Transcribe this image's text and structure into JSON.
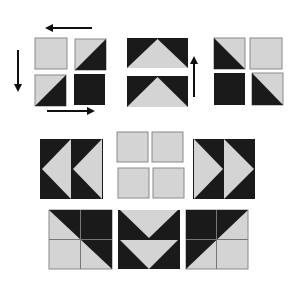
{
  "diagram": {
    "title": "",
    "colors": {
      "dark": "#1a1a1a",
      "light": "#d4d4d4",
      "outline": "#8a8a8a",
      "arrow": "#111111",
      "background": "#ffffff"
    },
    "groups": [
      {
        "id": "four-patch-rotation",
        "label": "Four-patch with half-square triangles rotated (arrows left, down, right)"
      },
      {
        "id": "flying-geese-up",
        "label": "Two flying geese units pointing up with up arrow"
      },
      {
        "id": "four-patch-hst-right",
        "label": "Four-patch of half-square triangles"
      },
      {
        "id": "flying-geese-left",
        "label": "Flying geese pair pointing left"
      },
      {
        "id": "plain-four-patch",
        "label": "Plain light four-patch"
      },
      {
        "id": "flying-geese-right",
        "label": "Flying geese pair pointing right"
      },
      {
        "id": "block-diagonal-left",
        "label": "Block with diagonal dark top-right"
      },
      {
        "id": "flying-geese-down",
        "label": "Flying geese pair pointing down"
      },
      {
        "id": "block-diagonal-right",
        "label": "Block with diagonal dark top-left"
      }
    ],
    "arrows": [
      {
        "id": "arrow-top",
        "direction": "left"
      },
      {
        "id": "arrow-left",
        "direction": "down"
      },
      {
        "id": "arrow-bottom",
        "direction": "right"
      },
      {
        "id": "arrow-middle",
        "direction": "up"
      }
    ]
  }
}
